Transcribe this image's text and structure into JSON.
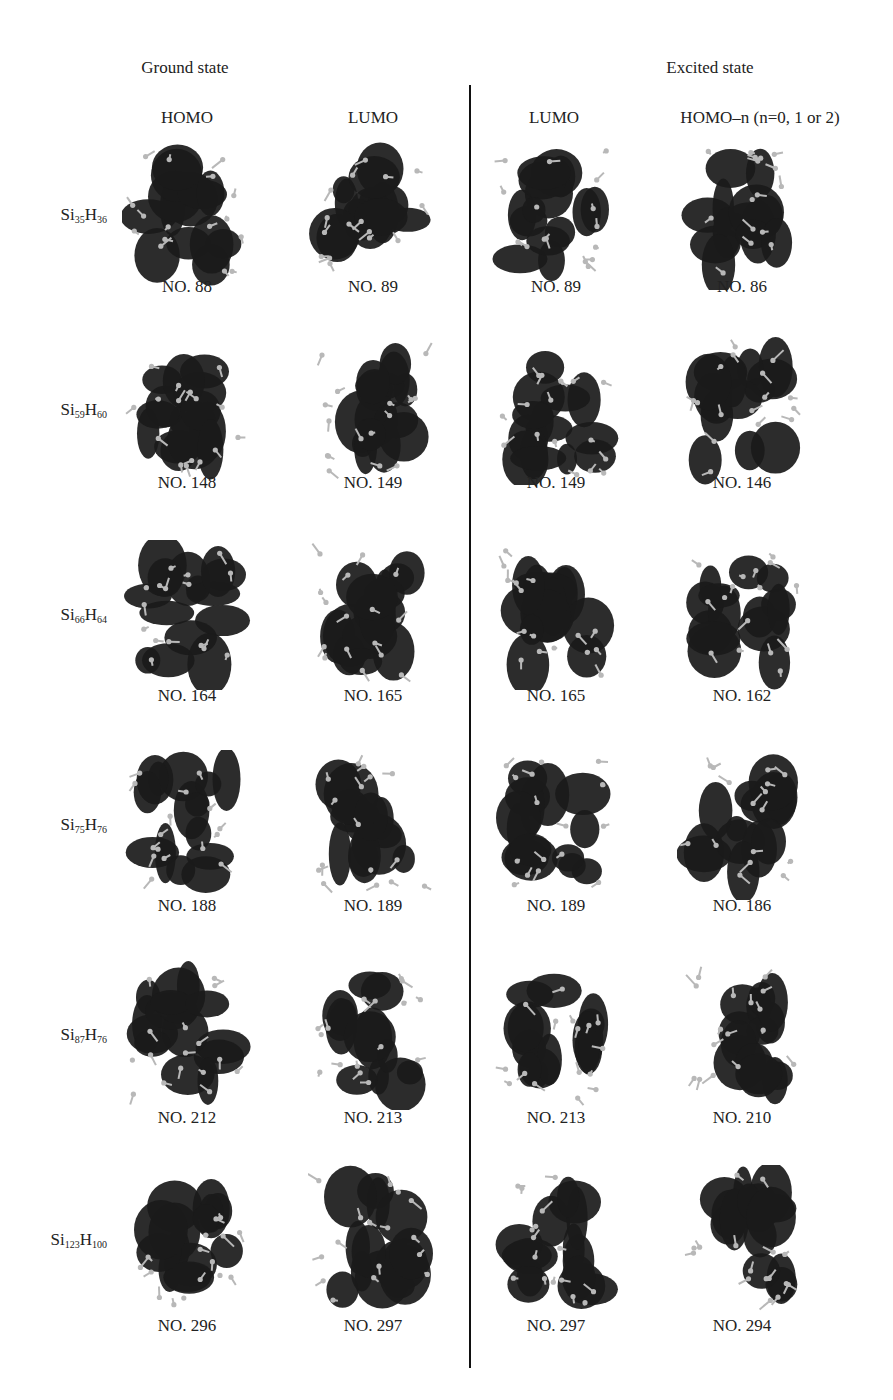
{
  "figure": {
    "section_headers": [
      {
        "label": "Ground state",
        "x": 185
      },
      {
        "label": "Excited state",
        "x": 710
      }
    ],
    "column_headers": [
      {
        "label": "HOMO",
        "x": 187
      },
      {
        "label": "LUMO",
        "x": 373
      },
      {
        "label": "LUMO",
        "x": 554
      },
      {
        "label": "HOMO–n (n=0, 1 or 2)",
        "x": 760
      }
    ],
    "column_centers": [
      187,
      373,
      556,
      742
    ],
    "rows": [
      {
        "si": "Si",
        "si_sub": "35",
        "h": "H",
        "h_sub": "36",
        "y_img": 140,
        "y_label": 277,
        "labels": [
          "NO. 88",
          "NO. 89",
          "NO. 89",
          "NO. 86"
        ]
      },
      {
        "si": "Si",
        "si_sub": "59",
        "h": "H",
        "h_sub": "60",
        "y_img": 335,
        "y_label": 473,
        "labels": [
          "NO. 148",
          "NO. 149",
          "NO. 149",
          "NO. 146"
        ]
      },
      {
        "si": "Si",
        "si_sub": "66",
        "h": "H",
        "h_sub": "64",
        "y_img": 540,
        "y_label": 686,
        "labels": [
          "NO. 164",
          "NO. 165",
          "NO. 165",
          "NO. 162"
        ]
      },
      {
        "si": "Si",
        "si_sub": "75",
        "h": "H",
        "h_sub": "76",
        "y_img": 750,
        "y_label": 896,
        "labels": [
          "NO. 188",
          "NO. 189",
          "NO. 189",
          "NO. 186"
        ]
      },
      {
        "si": "Si",
        "si_sub": "87",
        "h": "H",
        "h_sub": "76",
        "y_img": 960,
        "y_label": 1108,
        "labels": [
          "NO. 212",
          "NO. 213",
          "NO. 213",
          "NO. 210"
        ]
      },
      {
        "si": "Si",
        "si_sub": "123",
        "h": "H",
        "h_sub": "100",
        "y_img": 1165,
        "y_label": 1316,
        "labels": [
          "NO. 296",
          "NO. 297",
          "NO. 297",
          "NO. 294"
        ]
      }
    ],
    "colors": {
      "orbital": "#1a1a1a",
      "atom": "#b8b8b8",
      "divider": "#111111",
      "text": "#222222"
    }
  }
}
